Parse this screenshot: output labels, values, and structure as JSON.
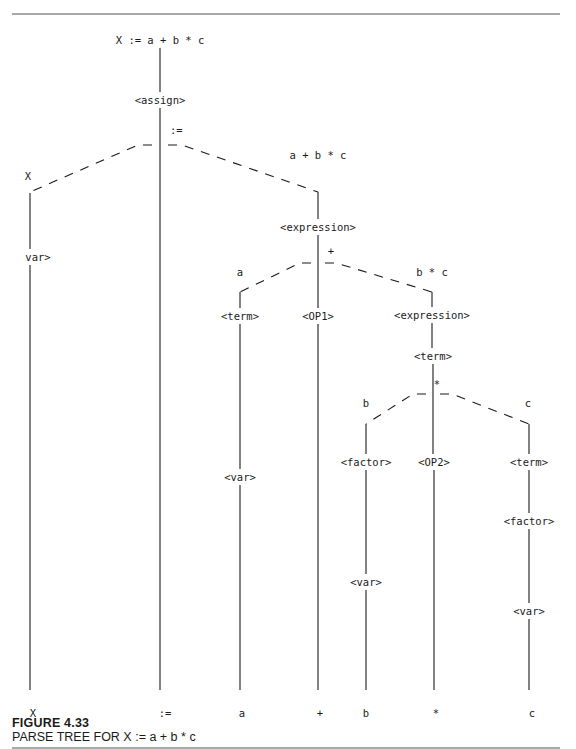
{
  "figure": {
    "number": "FIGURE 4.33",
    "title": "PARSE TREE FOR X := a + b * c"
  },
  "tree": {
    "root": "X := a + b * c",
    "nodes": {
      "assign": "<assign>",
      "assign_op_annotation": ":=",
      "left_annotation": "X",
      "right_annotation": "a + b * c",
      "var_left": "var>",
      "expression_1": "<expression>",
      "plus_annotation": "+",
      "a_annotation": "a",
      "bc_annotation": "b * c",
      "term_a": "<term>",
      "var_a": "<var>",
      "op1": "<OP1>",
      "expression_2": "<expression>",
      "term_bc": "<term>",
      "star_annotation": "*",
      "b_annotation": "b",
      "c_annotation": "c",
      "factor_b": "<factor>",
      "var_b": "<var>",
      "op2": "<OP2>",
      "term_c": "<term>",
      "factor_c": "<factor>",
      "var_c": "<var>"
    },
    "leaves": [
      "X",
      ":=",
      "a",
      "+",
      "b",
      "*",
      "c"
    ]
  }
}
